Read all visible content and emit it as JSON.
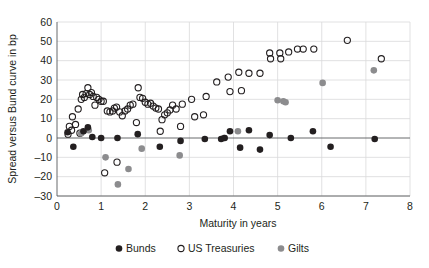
{
  "chart_data": {
    "type": "scatter",
    "title": "",
    "xlabel": "Maturity in years",
    "ylabel": "Spread versus Bund curve in bp",
    "xlim": [
      0,
      8
    ],
    "ylim": [
      -30,
      60
    ],
    "xticks": [
      0,
      1,
      2,
      3,
      4,
      5,
      6,
      7,
      8
    ],
    "yticks": [
      -30,
      -20,
      -10,
      0,
      10,
      20,
      30,
      40,
      50,
      60
    ],
    "xtick_labels": [
      "0",
      "1",
      "2",
      "3",
      "4",
      "5",
      "6",
      "7",
      "8"
    ],
    "ytick_labels": [
      "-30",
      "-20",
      "-10",
      "0",
      "10",
      "20",
      "30",
      "40",
      "50",
      "60"
    ],
    "grid": true,
    "grid_axis": "y",
    "legend_position": "bottom",
    "series": [
      {
        "name": "Bunds",
        "marker": "filled-circle",
        "color": "#231f20",
        "points": [
          [
            0.24,
            3.0
          ],
          [
            0.37,
            -4.5
          ],
          [
            0.6,
            3.5
          ],
          [
            0.7,
            5.5
          ],
          [
            0.8,
            0.5
          ],
          [
            1.0,
            0.0
          ],
          [
            1.37,
            0.0
          ],
          [
            1.83,
            2.0
          ],
          [
            2.33,
            -4.5
          ],
          [
            2.8,
            -1.5
          ],
          [
            3.35,
            -0.5
          ],
          [
            3.72,
            -0.5
          ],
          [
            3.8,
            0.0
          ],
          [
            3.92,
            3.5
          ],
          [
            4.15,
            -5.0
          ],
          [
            4.35,
            4.0
          ],
          [
            4.6,
            -6.0
          ],
          [
            4.82,
            1.5
          ],
          [
            5.3,
            0.0
          ],
          [
            5.8,
            3.5
          ],
          [
            6.2,
            -4.5
          ],
          [
            7.2,
            -0.5
          ]
        ]
      },
      {
        "name": "US Treasuries",
        "marker": "open-circle",
        "color": "#231f20",
        "points": [
          [
            0.25,
            2.0
          ],
          [
            0.28,
            6.0
          ],
          [
            0.33,
            4.0
          ],
          [
            0.35,
            11.0
          ],
          [
            0.42,
            7.0
          ],
          [
            0.48,
            15.0
          ],
          [
            0.52,
            2.5
          ],
          [
            0.55,
            20.0
          ],
          [
            0.58,
            22.5
          ],
          [
            0.62,
            21.0
          ],
          [
            0.66,
            23.0
          ],
          [
            0.7,
            26.0
          ],
          [
            0.74,
            22.5
          ],
          [
            0.78,
            23.5
          ],
          [
            0.82,
            21.5
          ],
          [
            0.86,
            17.0
          ],
          [
            0.9,
            21.0
          ],
          [
            0.95,
            20.0
          ],
          [
            1.0,
            19.0
          ],
          [
            1.05,
            19.0
          ],
          [
            1.08,
            -18.0
          ],
          [
            1.14,
            14.0
          ],
          [
            1.2,
            13.5
          ],
          [
            1.26,
            14.0
          ],
          [
            1.3,
            15.5
          ],
          [
            1.35,
            16.0
          ],
          [
            1.36,
            -12.5
          ],
          [
            1.42,
            13.5
          ],
          [
            1.48,
            11.5
          ],
          [
            1.54,
            14.0
          ],
          [
            1.6,
            15.0
          ],
          [
            1.66,
            17.0
          ],
          [
            1.72,
            17.5
          ],
          [
            1.8,
            8.0
          ],
          [
            1.84,
            26.0
          ],
          [
            1.88,
            21.0
          ],
          [
            1.94,
            20.5
          ],
          [
            2.0,
            18.5
          ],
          [
            2.06,
            17.5
          ],
          [
            2.12,
            18.0
          ],
          [
            2.18,
            16.5
          ],
          [
            2.24,
            15.5
          ],
          [
            2.3,
            15.0
          ],
          [
            2.34,
            3.5
          ],
          [
            2.38,
            9.5
          ],
          [
            2.44,
            12.0
          ],
          [
            2.5,
            13.0
          ],
          [
            2.56,
            14.5
          ],
          [
            2.62,
            17.0
          ],
          [
            2.7,
            15.0
          ],
          [
            2.8,
            6.0
          ],
          [
            2.84,
            17.5
          ],
          [
            3.05,
            20.0
          ],
          [
            3.12,
            11.0
          ],
          [
            3.32,
            12.0
          ],
          [
            3.38,
            21.5
          ],
          [
            3.62,
            29.0
          ],
          [
            3.88,
            31.5
          ],
          [
            3.92,
            24.0
          ],
          [
            4.12,
            34.0
          ],
          [
            4.18,
            24.5
          ],
          [
            4.35,
            33.5
          ],
          [
            4.6,
            33.5
          ],
          [
            4.82,
            44.0
          ],
          [
            4.84,
            41.0
          ],
          [
            5.05,
            44.0
          ],
          [
            5.07,
            41.0
          ],
          [
            5.25,
            44.5
          ],
          [
            5.45,
            46.0
          ],
          [
            5.58,
            46.0
          ],
          [
            5.82,
            46.0
          ],
          [
            6.58,
            50.5
          ],
          [
            7.35,
            41.0
          ]
        ]
      },
      {
        "name": "Gilts",
        "marker": "filled-circle",
        "color": "#8c8c8e",
        "points": [
          [
            0.55,
            2.5
          ],
          [
            0.72,
            4.0
          ],
          [
            1.1,
            -10.0
          ],
          [
            1.38,
            -24.0
          ],
          [
            1.62,
            -16.0
          ],
          [
            1.92,
            -5.5
          ],
          [
            2.78,
            -9.0
          ],
          [
            3.78,
            0.0
          ],
          [
            4.1,
            3.5
          ],
          [
            5.0,
            19.5
          ],
          [
            5.13,
            19.0
          ],
          [
            5.18,
            18.5
          ],
          [
            6.02,
            28.5
          ],
          [
            7.18,
            35.0
          ]
        ]
      }
    ]
  },
  "legend": {
    "items": [
      {
        "label": "Bunds",
        "marker": "filled-circle",
        "color": "#231f20"
      },
      {
        "label": "US Treasuries",
        "marker": "open-circle",
        "color": "#231f20"
      },
      {
        "label": "Gilts",
        "marker": "filled-circle",
        "color": "#8c8c8e"
      }
    ]
  },
  "colors": {
    "bunds": "#231f20",
    "us_treasuries": "#231f20",
    "gilts": "#8c8c8e",
    "grid": "#d9d9da",
    "axis": "#58595b",
    "background": "#ffffff"
  }
}
